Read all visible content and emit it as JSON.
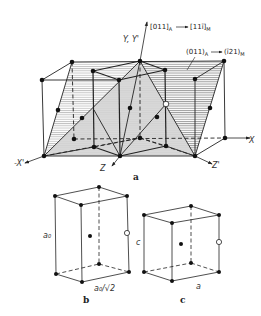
{
  "figure": {
    "panel_a": {
      "caption": "a",
      "axes": {
        "y": "Y, Y'",
        "x_pos": "X",
        "x_neg": "-X'",
        "z": "Z",
        "z_prime": "Z'"
      },
      "annotations": {
        "direction": {
          "from": "[011]",
          "from_sub": "A",
          "to": "[11ī]",
          "to_sub": "M"
        },
        "plane": {
          "from": "(011)",
          "from_sub": "A",
          "to": "(ī21)",
          "to_sub": "M"
        }
      }
    },
    "panel_b": {
      "caption": "b",
      "height_label": "a₀",
      "base_label": "a₀/√2"
    },
    "panel_c": {
      "caption": "c",
      "height_label": "c",
      "base_label": "a"
    }
  }
}
